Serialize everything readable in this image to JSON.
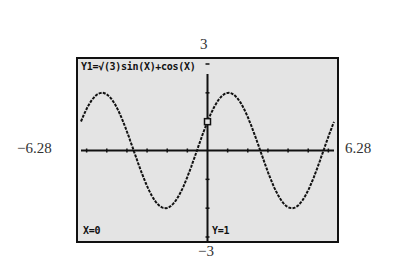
{
  "chart_data": {
    "type": "line",
    "title": "Y1=√(3)sin(X)+cos(X)",
    "function": "sqrt(3)*sin(x)+cos(x)",
    "xlabel": "",
    "ylabel": "",
    "xlim": [
      -6.28,
      6.28
    ],
    "ylim": [
      -3,
      3
    ],
    "x_tick_step": 1,
    "y_tick_step": 1,
    "grid": false,
    "series": [
      {
        "name": "Y1",
        "x": [
          -6.28,
          -5.24,
          -4.19,
          -3.67,
          -2.62,
          -1.57,
          -0.52,
          0,
          0.52,
          1.05,
          1.57,
          2.62,
          3.14,
          3.67,
          4.19,
          5.24,
          6.28
        ],
        "values": [
          0.99,
          2.0,
          1.0,
          0.0,
          -1.73,
          -1.73,
          0.0,
          1.0,
          1.73,
          2.0,
          1.73,
          0.0,
          -1.0,
          -1.73,
          -2.0,
          -1.0,
          0.99
        ]
      }
    ],
    "trace_cursor": {
      "x": 0,
      "y": 1
    },
    "window_labels": {
      "ymax": "3",
      "ymin": "−3",
      "xmin": "−6.28",
      "xmax": "6.28"
    }
  },
  "screen": {
    "equation": "Y1=√(3)sin(X)+cos(X)",
    "x_readout": "X=0",
    "y_readout": "Y=1"
  },
  "colors": {
    "screen_bg": "#e4e4e4",
    "ink": "#111111"
  }
}
